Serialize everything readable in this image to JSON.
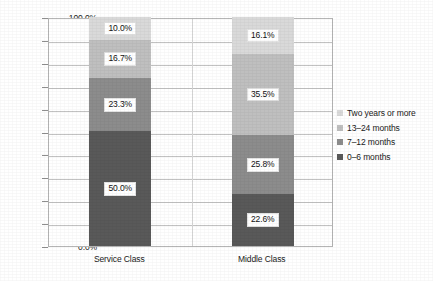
{
  "chart_data": {
    "type": "bar",
    "subtype": "stacked-100-percent",
    "title": "",
    "subtitle": "",
    "xlabel": "",
    "ylabel": "",
    "categories": [
      "Service Class",
      "Middle Class"
    ],
    "series": [
      {
        "name": "0–6 months",
        "values": [
          50.0,
          22.6
        ],
        "color": "#595959",
        "labels": [
          "50.0%",
          "22.6%"
        ]
      },
      {
        "name": "7–12 months",
        "values": [
          23.3,
          25.8
        ],
        "color": "#8c8c8c",
        "labels": [
          "23.3%",
          "25.8%"
        ]
      },
      {
        "name": "13–24 months",
        "values": [
          16.7,
          35.5
        ],
        "color": "#bfbfbf",
        "labels": [
          "16.7%",
          "35.5%"
        ]
      },
      {
        "name": "Two years or more",
        "values": [
          10.0,
          16.1
        ],
        "color": "#d9d9d9",
        "labels": [
          "10.0%",
          "16.1%"
        ]
      }
    ],
    "stack_order_bottom_to_top": [
      "0–6 months",
      "7–12 months",
      "13–24 months",
      "Two years or more"
    ],
    "ylim": [
      0,
      100
    ],
    "ytick_step": 10,
    "ytick_labels": [
      "0.0%",
      "10.0%",
      "20.0%",
      "30.0%",
      "40.0%",
      "50.0%",
      "60.0%",
      "70.0%",
      "80.0%",
      "90.0%",
      "100.0%"
    ],
    "grid": true,
    "grid_axis": "y",
    "legend_position": "right",
    "legend_order_top_to_bottom": [
      "Two years or more",
      "13–24 months",
      "7–12 months",
      "0–6 months"
    ],
    "annotations": []
  },
  "legend": {
    "items": [
      {
        "label": "Two years or more",
        "color": "#d9d9d9"
      },
      {
        "label": "13–24 months",
        "color": "#bfbfbf"
      },
      {
        "label": "7–12 months",
        "color": "#8c8c8c"
      },
      {
        "label": "0–6 months",
        "color": "#595959"
      }
    ]
  },
  "axis": {
    "y_ticks": [
      "100.0%",
      "90.0%",
      "80.0%",
      "70.0%",
      "60.0%",
      "50.0%",
      "40.0%",
      "30.0%",
      "20.0%",
      "10.0%",
      "0.0%"
    ]
  },
  "bars": [
    {
      "category": "Service Class",
      "segments_top_to_bottom": [
        {
          "label": "10.0%",
          "value": 10.0,
          "color": "#d9d9d9",
          "series": "Two years or more"
        },
        {
          "label": "16.7%",
          "value": 16.7,
          "color": "#bfbfbf",
          "series": "13–24 months"
        },
        {
          "label": "23.3%",
          "value": 23.3,
          "color": "#8c8c8c",
          "series": "7–12 months"
        },
        {
          "label": "50.0%",
          "value": 50.0,
          "color": "#595959",
          "series": "0–6 months"
        }
      ]
    },
    {
      "category": "Middle Class",
      "segments_top_to_bottom": [
        {
          "label": "16.1%",
          "value": 16.1,
          "color": "#d9d9d9",
          "series": "Two years or more"
        },
        {
          "label": "35.5%",
          "value": 35.5,
          "color": "#bfbfbf",
          "series": "13–24 months"
        },
        {
          "label": "25.8%",
          "value": 25.8,
          "color": "#8c8c8c",
          "series": "7–12 months"
        },
        {
          "label": "22.6%",
          "value": 22.6,
          "color": "#595959",
          "series": "0–6 months"
        }
      ]
    }
  ]
}
